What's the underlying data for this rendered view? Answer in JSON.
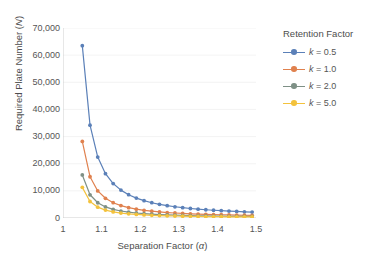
{
  "chart_data": {
    "type": "line",
    "title": "",
    "xlabel": "Separation Factor (α)",
    "xlabel_text": "Separation Factor (",
    "xlabel_sym": "α",
    "ylabel_text": "Required Plate Number (",
    "ylabel_sym": "N",
    "ylabel": "Required Plate Number (N)",
    "xlim": [
      1.0,
      1.5
    ],
    "ylim": [
      0,
      70000
    ],
    "xticks": [
      1,
      1.1,
      1.2,
      1.3,
      1.4,
      1.5
    ],
    "xticklabels": [
      "1",
      "1.1",
      "1.2",
      "1.3",
      "1.4",
      "1.5"
    ],
    "yticks": [
      0,
      10000,
      20000,
      30000,
      40000,
      50000,
      60000,
      70000
    ],
    "yticklabels": [
      "0",
      "10,000",
      "20,000",
      "30,000",
      "40,000",
      "50,000",
      "60,000",
      "70,000"
    ],
    "grid": "horizontal-faint",
    "legend_position": "right",
    "legend_title": "Retention Factor",
    "markers": "circle",
    "x": [
      1.05,
      1.07,
      1.09,
      1.11,
      1.13,
      1.15,
      1.17,
      1.19,
      1.21,
      1.23,
      1.25,
      1.27,
      1.29,
      1.31,
      1.33,
      1.35,
      1.37,
      1.39,
      1.41,
      1.43,
      1.45,
      1.47,
      1.49
    ],
    "series": [
      {
        "name": "k = 0.5",
        "k": 0.5,
        "color": "#5B80B8",
        "values": [
          63504,
          34214,
          22447,
          16348,
          12686,
          10276,
          8581,
          7332,
          6378,
          5629,
          5029,
          4538,
          4132,
          3790,
          3500,
          3251,
          3036,
          2848,
          2683,
          2538,
          2408,
          2292,
          2188
        ]
      },
      {
        "name": "k = 1.0",
        "k": 1.0,
        "color": "#E0814E",
        "values": [
          28224,
          15206,
          9976,
          7266,
          5638,
          4567,
          3814,
          3259,
          2835,
          2502,
          2235,
          2017,
          1836,
          1684,
          1556,
          1445,
          1349,
          1266,
          1192,
          1128,
          1070,
          1019,
          972
        ]
      },
      {
        "name": "k = 2.0",
        "k": 2.0,
        "color": "#7E9086",
        "values": [
          15876,
          8553,
          5612,
          4087,
          3171,
          2569,
          2145,
          1833,
          1595,
          1407,
          1257,
          1134,
          1033,
          947,
          875,
          813,
          759,
          712,
          671,
          634,
          602,
          573,
          547
        ]
      },
      {
        "name": "k = 5.0",
        "k": 5.0,
        "color": "#F3C23C",
        "values": [
          11289,
          6082,
          3990,
          2906,
          2255,
          1827,
          1525,
          1303,
          1134,
          1001,
          894,
          807,
          735,
          674,
          622,
          578,
          540,
          506,
          477,
          451,
          428,
          407,
          389
        ]
      }
    ]
  }
}
